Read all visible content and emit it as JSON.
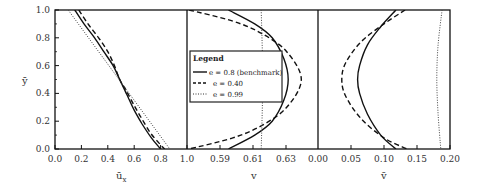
{
  "chart_data": [
    {
      "type": "line",
      "panel": 1,
      "xlabel": "ū_x",
      "ylabel": "ȳ",
      "xlim": [
        0.0,
        1.0
      ],
      "ylim": [
        0.0,
        1.0
      ],
      "xticks": [
        "0.0",
        "0.2",
        "0.4",
        "0.6",
        "0.8",
        "1.0"
      ],
      "yticks": [
        "0.0",
        "0.2",
        "0.4",
        "0.6",
        "0.8",
        "1.0"
      ],
      "series": [
        {
          "name": "e = 0.8 (benchmark)",
          "style": "solid",
          "points": [
            [
              0.15,
              1.0
            ],
            [
              0.22,
              0.9
            ],
            [
              0.3,
              0.8
            ],
            [
              0.37,
              0.7
            ],
            [
              0.44,
              0.6
            ],
            [
              0.49,
              0.5
            ],
            [
              0.53,
              0.42
            ],
            [
              0.56,
              0.36
            ],
            [
              0.6,
              0.28
            ],
            [
              0.66,
              0.18
            ],
            [
              0.73,
              0.08
            ],
            [
              0.8,
              0.0
            ]
          ]
        },
        {
          "name": "e = 0.40",
          "style": "dashed",
          "points": [
            [
              0.18,
              1.0
            ],
            [
              0.25,
              0.9
            ],
            [
              0.33,
              0.8
            ],
            [
              0.4,
              0.7
            ],
            [
              0.45,
              0.6
            ],
            [
              0.49,
              0.5
            ],
            [
              0.54,
              0.42
            ],
            [
              0.59,
              0.33
            ],
            [
              0.65,
              0.23
            ],
            [
              0.72,
              0.12
            ],
            [
              0.79,
              0.04
            ],
            [
              0.83,
              0.0
            ]
          ]
        },
        {
          "name": "e = 0.99",
          "style": "dotted",
          "points": [
            [
              0.1,
              1.0
            ],
            [
              0.87,
              0.0
            ]
          ]
        }
      ]
    },
    {
      "type": "line",
      "panel": 2,
      "xlabel": "v",
      "xticks": [
        "1.0",
        "0.59",
        "0.61",
        "0.63"
      ],
      "ylim": [
        0.0,
        1.0
      ],
      "series": [
        {
          "name": "e = 0.8 (benchmark)",
          "style": "solid",
          "points": [
            [
              0.602,
              1.0
            ],
            [
              0.62,
              0.9
            ],
            [
              0.632,
              0.8
            ],
            [
              0.64,
              0.65
            ],
            [
              0.643,
              0.5
            ],
            [
              0.64,
              0.35
            ],
            [
              0.632,
              0.2
            ],
            [
              0.62,
              0.1
            ],
            [
              0.602,
              0.0
            ]
          ]
        },
        {
          "name": "e = 0.40",
          "style": "dashed",
          "points": [
            [
              0.575,
              1.0
            ],
            [
              0.605,
              0.92
            ],
            [
              0.625,
              0.83
            ],
            [
              0.642,
              0.7
            ],
            [
              0.652,
              0.5
            ],
            [
              0.642,
              0.3
            ],
            [
              0.625,
              0.17
            ],
            [
              0.605,
              0.08
            ],
            [
              0.575,
              0.0
            ]
          ]
        },
        {
          "name": "e = 0.99",
          "style": "dotted",
          "points": [
            [
              0.6245,
              1.0
            ],
            [
              0.6255,
              0.5
            ],
            [
              0.6245,
              0.0
            ]
          ]
        }
      ]
    },
    {
      "type": "line",
      "panel": 3,
      "xlabel": "v̄",
      "xlim": [
        0.0,
        0.2
      ],
      "xticks": [
        "0.00",
        "0.05",
        "0.10",
        "0.15",
        "0.20"
      ],
      "ylim": [
        0.0,
        1.0
      ],
      "series": [
        {
          "name": "e = 0.8 (benchmark)",
          "style": "solid",
          "points": [
            [
              0.118,
              1.0
            ],
            [
              0.095,
              0.88
            ],
            [
              0.075,
              0.75
            ],
            [
              0.063,
              0.6
            ],
            [
              0.06,
              0.5
            ],
            [
              0.063,
              0.4
            ],
            [
              0.075,
              0.25
            ],
            [
              0.095,
              0.1
            ],
            [
              0.118,
              0.0
            ]
          ]
        },
        {
          "name": "e = 0.40",
          "style": "dashed",
          "points": [
            [
              0.132,
              1.0
            ],
            [
              0.1,
              0.9
            ],
            [
              0.065,
              0.77
            ],
            [
              0.042,
              0.62
            ],
            [
              0.036,
              0.5
            ],
            [
              0.042,
              0.38
            ],
            [
              0.065,
              0.22
            ],
            [
              0.1,
              0.08
            ],
            [
              0.135,
              0.0
            ]
          ]
        },
        {
          "name": "e = 0.99",
          "style": "dotted",
          "points": [
            [
              0.188,
              1.0
            ],
            [
              0.182,
              0.75
            ],
            [
              0.18,
              0.5
            ],
            [
              0.182,
              0.25
            ],
            [
              0.186,
              0.0
            ]
          ]
        }
      ]
    }
  ],
  "legend": {
    "title": "Legend",
    "entries": [
      {
        "label": "e = 0.8 (benchmark)",
        "style": "solid"
      },
      {
        "label": "e = 0.40",
        "style": "dashed"
      },
      {
        "label": "e = 0.99",
        "style": "dotted"
      }
    ]
  },
  "axes": {
    "y_label": "ȳ",
    "panel1_xlabel": "ū",
    "panel1_xlabel_sub": "x",
    "panel2_xlabel": "v",
    "panel3_xlabel": "v̄"
  }
}
